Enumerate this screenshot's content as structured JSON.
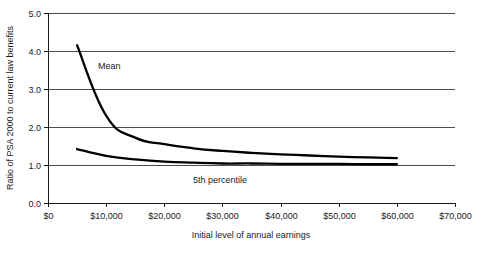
{
  "chart_data": {
    "type": "line",
    "title": "",
    "xlabel": "Initial level of annual earnings",
    "ylabel": "Ratio of PSA 2000 to current law benefits",
    "xlim": [
      0,
      70000
    ],
    "ylim": [
      0,
      5.0
    ],
    "grid": true,
    "legend_position": "inline-annotations",
    "x_tick_labels": [
      "$0",
      "$10,000",
      "$20,000",
      "$30,000",
      "$40,000",
      "$50,000",
      "$60,000",
      "$70,000"
    ],
    "x_tick_values": [
      0,
      10000,
      20000,
      30000,
      40000,
      50000,
      60000,
      70000
    ],
    "y_tick_labels": [
      "0.0",
      "1.0",
      "2.0",
      "3.0",
      "4.0",
      "5.0"
    ],
    "y_tick_values": [
      0.0,
      1.0,
      2.0,
      3.0,
      4.0,
      5.0
    ],
    "x": [
      5000,
      10000,
      15000,
      20000,
      25000,
      30000,
      35000,
      40000,
      45000,
      50000,
      55000,
      60000
    ],
    "series": [
      {
        "name": "Mean",
        "annotation_label": "Mean",
        "color": "#000000",
        "values": [
          4.15,
          2.3,
          1.72,
          1.55,
          1.44,
          1.37,
          1.32,
          1.28,
          1.25,
          1.22,
          1.2,
          1.18
        ]
      },
      {
        "name": "5th percentile",
        "annotation_label": "5th percentile",
        "color": "#000000",
        "values": [
          1.42,
          1.24,
          1.15,
          1.09,
          1.06,
          1.04,
          1.04,
          1.03,
          1.03,
          1.03,
          1.02,
          1.02
        ]
      }
    ]
  }
}
